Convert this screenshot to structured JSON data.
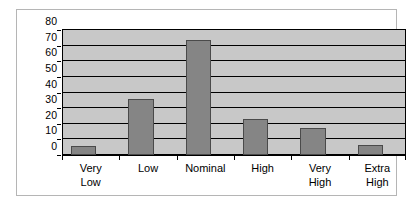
{
  "chart_data": {
    "type": "bar",
    "title": "",
    "subtitle": "",
    "xlabel": "",
    "ylabel": "",
    "categories": [
      "Very Low",
      "Low",
      "Nominal",
      "High",
      "Very High",
      "Extra High"
    ],
    "category_lines": [
      [
        "Very",
        "Low"
      ],
      [
        "Low"
      ],
      [
        "Nominal"
      ],
      [
        "High"
      ],
      [
        "Very",
        "High"
      ],
      [
        "Extra",
        "High"
      ]
    ],
    "values": [
      6,
      36,
      73.5,
      23,
      17.5,
      6.5
    ],
    "ylim": [
      0,
      80
    ],
    "ytick_values": [
      0,
      10,
      20,
      30,
      40,
      50,
      60,
      70,
      80
    ],
    "ytick_labels": [
      "0",
      "10",
      "20",
      "30",
      "40",
      "50",
      "60",
      "70",
      "80"
    ],
    "grid": true,
    "grid_axis": "y",
    "legend": null,
    "legend_position": "none",
    "annotations": [],
    "colors": {
      "bar_fill": "#858585",
      "bar_edge": "#4a4a4a",
      "plot_background": "#c8c8c8",
      "grid": "#000000",
      "axis": "#000000",
      "text": "#000000",
      "figure_background": "#ffffff",
      "figure_border": "#b5b5b5"
    }
  }
}
